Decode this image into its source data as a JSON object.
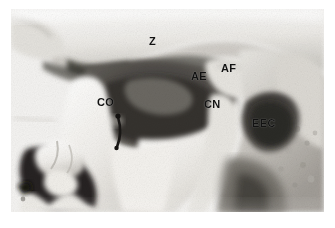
{
  "figure": {
    "kind": "grayscale-photograph",
    "page_background": "#ffffff",
    "plate": {
      "left": 11,
      "top": 9,
      "width": 313,
      "height": 203,
      "border": "none",
      "tone_light": "#f2f1ef",
      "tone_mid": "#b9b7b2",
      "tone_dark": "#585552",
      "tone_deepest": "#1c1a18"
    }
  },
  "annotations": [
    {
      "id": "Z",
      "text": "Z",
      "meaning": "zygomatic-arch",
      "x": 149,
      "y": 36,
      "font_size": 11
    },
    {
      "id": "AE",
      "text": "AE",
      "meaning": "anterior-eminence",
      "x": 191,
      "y": 71,
      "font_size": 11
    },
    {
      "id": "AF",
      "text": "AF",
      "meaning": "articular-fossa",
      "x": 221,
      "y": 63,
      "font_size": 11
    },
    {
      "id": "CO",
      "text": "CO",
      "meaning": "coronoid-process",
      "x": 97,
      "y": 97,
      "font_size": 11
    },
    {
      "id": "CN",
      "text": "CN",
      "meaning": "condyle-neck",
      "x": 204,
      "y": 99,
      "font_size": 11
    },
    {
      "id": "EEC",
      "text": "EEC",
      "meaning": "external-ear-canal",
      "x": 252,
      "y": 118,
      "font_size": 11
    }
  ],
  "markers": [
    {
      "id": "probe-pin",
      "kind": "curved-dark-probe",
      "meaning": "metal-probe-marker",
      "color": "#191715"
    }
  ]
}
